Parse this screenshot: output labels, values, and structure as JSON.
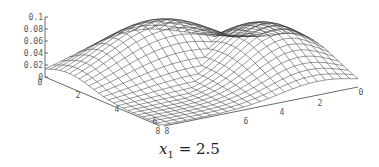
{
  "chart_data": {
    "type": "surface3d",
    "title": "",
    "caption": {
      "var": "x",
      "sub": "1",
      "eq": " = 2.5"
    },
    "zaxis": {
      "ticks": [
        "0",
        "0.02",
        "0.04",
        "0.06",
        "0.08",
        "0.1"
      ],
      "range": [
        0,
        0.1
      ]
    },
    "xaxis_left": {
      "ticks": [
        "0",
        "2",
        "4",
        "6",
        "8"
      ],
      "range": [
        0,
        8
      ]
    },
    "xaxis_right": {
      "ticks": [
        "0",
        "2",
        "4",
        "6",
        "8"
      ],
      "range": [
        0,
        8
      ]
    },
    "surface": {
      "description": "Wireframe surface, low (~0) near the axis corners and the front corner, rising to a plateau ~0.08 along the back ridge; two humps meeting with a slight saddle in the middle",
      "grid": 24,
      "peak_value": 0.08,
      "min_value": 0
    },
    "grid": false,
    "colors": {
      "mesh": "#333333",
      "axis": "#444444",
      "label": "#555555"
    }
  }
}
